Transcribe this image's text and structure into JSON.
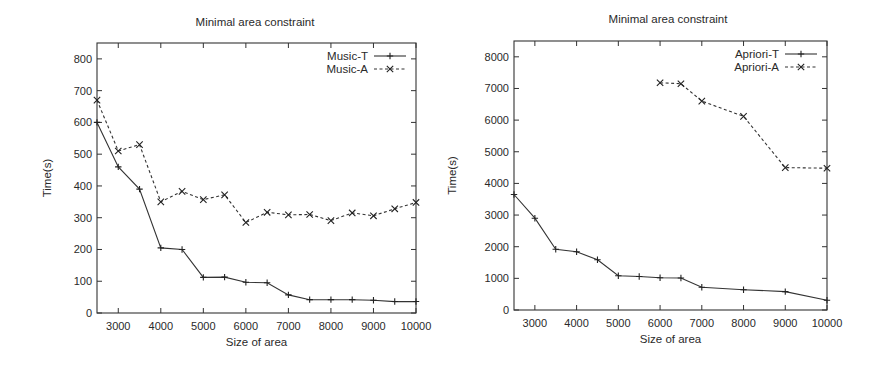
{
  "chart_data": [
    {
      "type": "line",
      "title": "Minimal area constraint",
      "xlabel": "Size of area",
      "ylabel": "Time(s)",
      "xlim": [
        2500,
        10000
      ],
      "ylim": [
        0,
        850
      ],
      "xticks": [
        3000,
        4000,
        5000,
        6000,
        7000,
        8000,
        9000,
        10000
      ],
      "yticks": [
        0,
        100,
        200,
        300,
        400,
        500,
        600,
        700,
        800
      ],
      "grid": false,
      "legend_position": "top-right",
      "series": [
        {
          "name": "Music-T",
          "style": "solid",
          "marker": "+",
          "x": [
            2500,
            3000,
            3500,
            4000,
            4500,
            5000,
            5500,
            6000,
            6500,
            7000,
            7500,
            8000,
            8500,
            9000,
            9500,
            10000
          ],
          "values": [
            600,
            460,
            390,
            205,
            200,
            112,
            113,
            97,
            95,
            57,
            42,
            42,
            42,
            40,
            36,
            36
          ]
        },
        {
          "name": "Music-A",
          "style": "dashed",
          "marker": "x",
          "x": [
            2500,
            3000,
            3500,
            4000,
            4500,
            5000,
            5500,
            6000,
            6500,
            7000,
            7500,
            8000,
            8500,
            9000,
            9500,
            10000
          ],
          "values": [
            670,
            510,
            530,
            350,
            383,
            357,
            372,
            285,
            317,
            309,
            310,
            291,
            315,
            306,
            328,
            348
          ]
        }
      ]
    },
    {
      "type": "line",
      "title": "Minimal area constraint",
      "xlabel": "Size of area",
      "ylabel": "Time(s)",
      "xlim": [
        2500,
        10000
      ],
      "ylim": [
        0,
        8500
      ],
      "xticks": [
        3000,
        4000,
        5000,
        6000,
        7000,
        8000,
        9000,
        10000
      ],
      "yticks": [
        0,
        1000,
        2000,
        3000,
        4000,
        5000,
        6000,
        7000,
        8000
      ],
      "grid": false,
      "legend_position": "top-right",
      "series": [
        {
          "name": "Apriori-T",
          "style": "solid",
          "marker": "+",
          "x": [
            2500,
            3000,
            3500,
            4000,
            4500,
            5000,
            5500,
            6000,
            6500,
            7000,
            8000,
            9000,
            10000
          ],
          "values": [
            3650,
            2900,
            1920,
            1840,
            1590,
            1080,
            1060,
            1020,
            1010,
            720,
            640,
            580,
            310
          ]
        },
        {
          "name": "Apriori-A",
          "style": "dashed",
          "marker": "x",
          "x": [
            6000,
            6500,
            7000,
            8000,
            9000,
            10000
          ],
          "values": [
            7180,
            7150,
            6600,
            6120,
            4500,
            4480
          ]
        }
      ]
    }
  ],
  "layout": [
    {
      "plot": {
        "left": 97,
        "top": 43,
        "right": 416,
        "bottom": 313
      },
      "title_x": 255,
      "title_y": 26
    },
    {
      "plot": {
        "left": 74,
        "top": 41,
        "right": 387,
        "bottom": 310
      },
      "title_x": 228,
      "title_y": 23
    }
  ]
}
